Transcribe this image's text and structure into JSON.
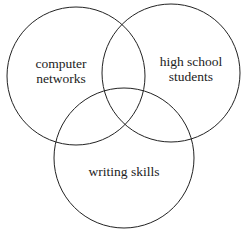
{
  "diagram": {
    "type": "venn",
    "stroke_color": "#222222",
    "sets": [
      {
        "id": "computer-networks",
        "label_lines": [
          "computer",
          "networks"
        ]
      },
      {
        "id": "high-school-students",
        "label_lines": [
          "high school",
          "students"
        ]
      },
      {
        "id": "writing-skills",
        "label_lines": [
          "writing skills"
        ]
      }
    ]
  }
}
